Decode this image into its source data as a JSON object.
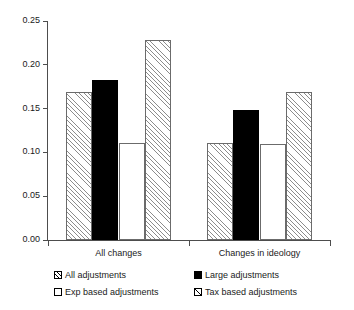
{
  "chart_data": {
    "type": "bar",
    "title": "",
    "subtitle": "",
    "xlabel": "",
    "ylabel": "",
    "categories": [
      "All changes",
      "Changes in ideology"
    ],
    "series": [
      {
        "name": "All adjustments",
        "marker": "diagonal-hatch",
        "values": [
          0.169,
          0.111
        ]
      },
      {
        "name": "Large adjustments",
        "marker": "solid-black",
        "values": [
          0.183,
          0.148
        ]
      },
      {
        "name": "Exp based adjustments",
        "marker": "open-white",
        "values": [
          0.111,
          0.11
        ]
      },
      {
        "name": "Tax based adjustments",
        "marker": "diagonal-hatch",
        "values": [
          0.228,
          0.169
        ]
      }
    ],
    "ylim": [
      0.0,
      0.25
    ],
    "yticks": [
      "0.00",
      "0.05",
      "0.10",
      "0.15",
      "0.20",
      "0.25"
    ],
    "ytick_values": [
      0.0,
      0.05,
      0.1,
      0.15,
      0.2,
      0.25
    ],
    "grid": false,
    "legend_position": "bottom",
    "legend_columns": 2
  },
  "axes": {
    "axis_color": "#4d4d4d",
    "text_color": "#1a1a1a"
  }
}
